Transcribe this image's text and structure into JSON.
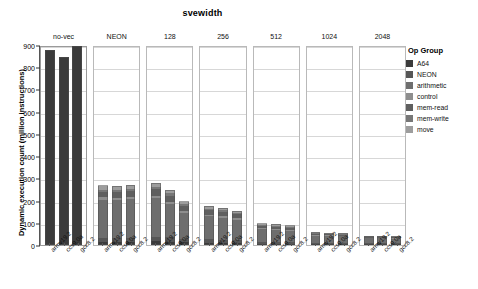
{
  "chart_data": {
    "type": "bar",
    "title": "svewidth",
    "xlabel": "",
    "ylabel": "Dynamic execution count (million instructions)",
    "ylim": [
      0,
      900
    ],
    "yticks": [
      0,
      100,
      200,
      300,
      400,
      500,
      600,
      700,
      800,
      900
    ],
    "grid": true,
    "stacked": true,
    "legend_title": "Op Group",
    "legend_position": "right",
    "facet_variable": "svewidth",
    "facets": [
      "no-vec",
      "NEON",
      "128",
      "256",
      "512",
      "1024",
      "2048"
    ],
    "categories": [
      "armv19.2",
      "ccs9.0a",
      "gcc8.2"
    ],
    "series": [
      {
        "name": "A64",
        "color": "#3b3b3b"
      },
      {
        "name": "NEON",
        "color": "#565656"
      },
      {
        "name": "arithmetic",
        "color": "#6e6e6e"
      },
      {
        "name": "control",
        "color": "#8e8e8e"
      },
      {
        "name": "mem-read",
        "color": "#5f5f5f"
      },
      {
        "name": "mem-write",
        "color": "#777777"
      },
      {
        "name": "move",
        "color": "#9d9d9d"
      }
    ],
    "facet_values": [
      {
        "facet": "no-vec",
        "bars": [
          {
            "category": "armv19.2",
            "total": 877,
            "segments": [
              {
                "name": "A64",
                "value": 877
              }
            ]
          },
          {
            "category": "ccs9.0a",
            "total": 845,
            "segments": [
              {
                "name": "A64",
                "value": 845
              }
            ]
          },
          {
            "category": "gcc8.2",
            "total": 895,
            "segments": [
              {
                "name": "A64",
                "value": 895
              }
            ]
          }
        ]
      },
      {
        "facet": "NEON",
        "bars": [
          {
            "category": "armv19.2",
            "total": 268,
            "segments": [
              {
                "name": "A64",
                "value": 14
              },
              {
                "name": "NEON",
                "value": 18
              },
              {
                "name": "arithmetic",
                "value": 172
              },
              {
                "name": "control",
                "value": 10
              },
              {
                "name": "mem-read",
                "value": 26
              },
              {
                "name": "mem-write",
                "value": 10
              },
              {
                "name": "move",
                "value": 18
              }
            ]
          },
          {
            "category": "ccs9.0a",
            "total": 266,
            "segments": [
              {
                "name": "A64",
                "value": 13
              },
              {
                "name": "NEON",
                "value": 17
              },
              {
                "name": "arithmetic",
                "value": 171
              },
              {
                "name": "control",
                "value": 10
              },
              {
                "name": "mem-read",
                "value": 27
              },
              {
                "name": "mem-write",
                "value": 10
              },
              {
                "name": "move",
                "value": 18
              }
            ]
          },
          {
            "category": "gcc8.2",
            "total": 270,
            "segments": [
              {
                "name": "A64",
                "value": 14
              },
              {
                "name": "NEON",
                "value": 18
              },
              {
                "name": "arithmetic",
                "value": 173
              },
              {
                "name": "control",
                "value": 10
              },
              {
                "name": "mem-read",
                "value": 27
              },
              {
                "name": "mem-write",
                "value": 10
              },
              {
                "name": "move",
                "value": 18
              }
            ]
          }
        ]
      },
      {
        "facet": "128",
        "bars": [
          {
            "category": "armv19.2",
            "total": 281,
            "segments": [
              {
                "name": "A64",
                "value": 16
              },
              {
                "name": "NEON",
                "value": 22
              },
              {
                "name": "arithmetic",
                "value": 172
              },
              {
                "name": "control",
                "value": 11
              },
              {
                "name": "mem-read",
                "value": 30
              },
              {
                "name": "mem-write",
                "value": 12
              },
              {
                "name": "move",
                "value": 18
              }
            ]
          },
          {
            "category": "ccs9.0a",
            "total": 248,
            "segments": [
              {
                "name": "A64",
                "value": 15
              },
              {
                "name": "NEON",
                "value": 20
              },
              {
                "name": "arithmetic",
                "value": 150
              },
              {
                "name": "control",
                "value": 10
              },
              {
                "name": "mem-read",
                "value": 27
              },
              {
                "name": "mem-write",
                "value": 10
              },
              {
                "name": "move",
                "value": 16
              }
            ]
          },
          {
            "category": "gcc8.2",
            "total": 196,
            "segments": [
              {
                "name": "A64",
                "value": 12
              },
              {
                "name": "NEON",
                "value": 16
              },
              {
                "name": "arithmetic",
                "value": 118
              },
              {
                "name": "control",
                "value": 8
              },
              {
                "name": "mem-read",
                "value": 21
              },
              {
                "name": "mem-write",
                "value": 8
              },
              {
                "name": "move",
                "value": 13
              }
            ]
          }
        ]
      },
      {
        "facet": "256",
        "bars": [
          {
            "category": "armv19.2",
            "total": 175,
            "segments": [
              {
                "name": "A64",
                "value": 11
              },
              {
                "name": "NEON",
                "value": 14
              },
              {
                "name": "arithmetic",
                "value": 104
              },
              {
                "name": "control",
                "value": 7
              },
              {
                "name": "mem-read",
                "value": 20
              },
              {
                "name": "mem-write",
                "value": 7
              },
              {
                "name": "move",
                "value": 12
              }
            ]
          },
          {
            "category": "ccs9.0a",
            "total": 168,
            "segments": [
              {
                "name": "A64",
                "value": 10
              },
              {
                "name": "NEON",
                "value": 13
              },
              {
                "name": "arithmetic",
                "value": 100
              },
              {
                "name": "control",
                "value": 7
              },
              {
                "name": "mem-read",
                "value": 19
              },
              {
                "name": "mem-write",
                "value": 7
              },
              {
                "name": "move",
                "value": 12
              }
            ]
          },
          {
            "category": "gcc8.2",
            "total": 155,
            "segments": [
              {
                "name": "A64",
                "value": 10
              },
              {
                "name": "NEON",
                "value": 12
              },
              {
                "name": "arithmetic",
                "value": 92
              },
              {
                "name": "control",
                "value": 6
              },
              {
                "name": "mem-read",
                "value": 18
              },
              {
                "name": "mem-write",
                "value": 6
              },
              {
                "name": "move",
                "value": 11
              }
            ]
          }
        ]
      },
      {
        "facet": "512",
        "bars": [
          {
            "category": "armv19.2",
            "total": 97,
            "segments": [
              {
                "name": "A64",
                "value": 6
              },
              {
                "name": "NEON",
                "value": 8
              },
              {
                "name": "arithmetic",
                "value": 57
              },
              {
                "name": "control",
                "value": 4
              },
              {
                "name": "mem-read",
                "value": 11
              },
              {
                "name": "mem-write",
                "value": 4
              },
              {
                "name": "move",
                "value": 7
              }
            ]
          },
          {
            "category": "ccs9.0a",
            "total": 93,
            "segments": [
              {
                "name": "A64",
                "value": 6
              },
              {
                "name": "NEON",
                "value": 7
              },
              {
                "name": "arithmetic",
                "value": 55
              },
              {
                "name": "control",
                "value": 4
              },
              {
                "name": "mem-read",
                "value": 11
              },
              {
                "name": "mem-write",
                "value": 4
              },
              {
                "name": "move",
                "value": 6
              }
            ]
          },
          {
            "category": "gcc8.2",
            "total": 88,
            "segments": [
              {
                "name": "A64",
                "value": 5
              },
              {
                "name": "NEON",
                "value": 7
              },
              {
                "name": "arithmetic",
                "value": 52
              },
              {
                "name": "control",
                "value": 4
              },
              {
                "name": "mem-read",
                "value": 10
              },
              {
                "name": "mem-write",
                "value": 4
              },
              {
                "name": "move",
                "value": 6
              }
            ]
          }
        ]
      },
      {
        "facet": "1024",
        "bars": [
          {
            "category": "armv19.2",
            "total": 57,
            "segments": [
              {
                "name": "A64",
                "value": 4
              },
              {
                "name": "NEON",
                "value": 5
              },
              {
                "name": "arithmetic",
                "value": 33
              },
              {
                "name": "control",
                "value": 2
              },
              {
                "name": "mem-read",
                "value": 6
              },
              {
                "name": "mem-write",
                "value": 3
              },
              {
                "name": "move",
                "value": 4
              }
            ]
          },
          {
            "category": "ccs9.0a",
            "total": 55,
            "segments": [
              {
                "name": "A64",
                "value": 4
              },
              {
                "name": "NEON",
                "value": 5
              },
              {
                "name": "arithmetic",
                "value": 32
              },
              {
                "name": "control",
                "value": 2
              },
              {
                "name": "mem-read",
                "value": 6
              },
              {
                "name": "mem-write",
                "value": 2
              },
              {
                "name": "move",
                "value": 4
              }
            ]
          },
          {
            "category": "gcc8.2",
            "total": 53,
            "segments": [
              {
                "name": "A64",
                "value": 3
              },
              {
                "name": "NEON",
                "value": 5
              },
              {
                "name": "arithmetic",
                "value": 31
              },
              {
                "name": "control",
                "value": 2
              },
              {
                "name": "mem-read",
                "value": 6
              },
              {
                "name": "mem-write",
                "value": 2
              },
              {
                "name": "move",
                "value": 4
              }
            ]
          }
        ]
      },
      {
        "facet": "2048",
        "bars": [
          {
            "category": "armv19.2",
            "total": 42,
            "segments": [
              {
                "name": "A64",
                "value": 3
              },
              {
                "name": "NEON",
                "value": 4
              },
              {
                "name": "arithmetic",
                "value": 24
              },
              {
                "name": "control",
                "value": 2
              },
              {
                "name": "mem-read",
                "value": 5
              },
              {
                "name": "mem-write",
                "value": 2
              },
              {
                "name": "move",
                "value": 2
              }
            ]
          },
          {
            "category": "ccs9.0a",
            "total": 41,
            "segments": [
              {
                "name": "A64",
                "value": 3
              },
              {
                "name": "NEON",
                "value": 4
              },
              {
                "name": "arithmetic",
                "value": 23
              },
              {
                "name": "control",
                "value": 2
              },
              {
                "name": "mem-read",
                "value": 5
              },
              {
                "name": "mem-write",
                "value": 2
              },
              {
                "name": "move",
                "value": 2
              }
            ]
          },
          {
            "category": "gcc8.2",
            "total": 40,
            "segments": [
              {
                "name": "A64",
                "value": 3
              },
              {
                "name": "NEON",
                "value": 4
              },
              {
                "name": "arithmetic",
                "value": 22
              },
              {
                "name": "control",
                "value": 2
              },
              {
                "name": "mem-read",
                "value": 5
              },
              {
                "name": "mem-write",
                "value": 2
              },
              {
                "name": "move",
                "value": 2
              }
            ]
          }
        ]
      }
    ]
  }
}
